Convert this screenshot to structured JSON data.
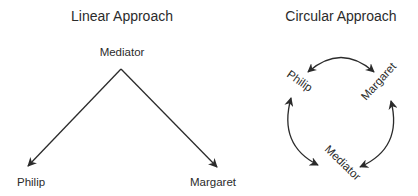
{
  "linear": {
    "title": "Linear Approach",
    "nodes": {
      "top": "Mediator",
      "left": "Philip",
      "right": "Margaret"
    }
  },
  "circular": {
    "title": "Circular Approach",
    "nodes": {
      "top_left": "Philip",
      "top_right": "Margaret",
      "bottom": "Mediator"
    }
  },
  "colors": {
    "line": "#2b2b2b",
    "text": "#2b2b2b",
    "background": "#ffffff"
  }
}
